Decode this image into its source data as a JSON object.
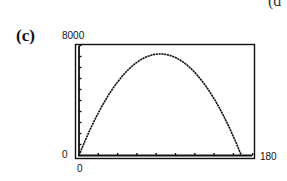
{
  "figure": {
    "panel_label": "(c)",
    "corner_fragment": "(d"
  },
  "window": {
    "ymax_label": "8000",
    "ymin_label": "0",
    "xmin_label": "0",
    "xmax_label": "180"
  },
  "chart_data": {
    "type": "line",
    "title": "",
    "panel": "(c)",
    "xlabel": "",
    "ylabel": "",
    "xlim": [
      0,
      180
    ],
    "ylim": [
      0,
      8000
    ],
    "grid": false,
    "legend": null,
    "x_tick_count": 9,
    "y_tick_count": 10,
    "x": [
      0,
      10,
      20,
      30,
      40,
      50,
      60,
      70,
      80,
      83,
      90,
      100,
      110,
      120,
      130,
      140,
      150,
      160,
      167
    ],
    "y": [
      0,
      1650,
      3030,
      4150,
      5010,
      5610,
      6010,
      6250,
      7340,
      7350,
      7290,
      7080,
      6540,
      5750,
      4680,
      3390,
      2580,
      1170,
      0
    ]
  }
}
